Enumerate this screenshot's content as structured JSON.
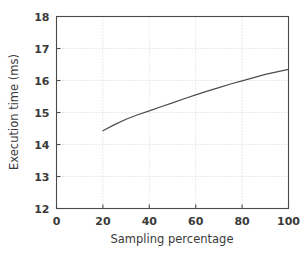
{
  "chart_data": {
    "type": "line",
    "title": "",
    "xlabel": "Sampling percentage",
    "ylabel": "Execution time (ms)",
    "xlim": [
      0,
      100
    ],
    "ylim": [
      12,
      18
    ],
    "xticks": [
      0,
      20,
      40,
      60,
      80,
      100
    ],
    "yticks": [
      12,
      13,
      14,
      15,
      16,
      17,
      18
    ],
    "xtick_labels": [
      "0",
      "20",
      "40",
      "60",
      "80",
      "100"
    ],
    "ytick_labels": [
      "12",
      "13",
      "14",
      "15",
      "16",
      "17",
      "18"
    ],
    "grid": true,
    "grid_style": "dotted",
    "legend": false,
    "legend_position": "none",
    "series": [
      {
        "name": "Execution time",
        "color": "#4d4d4d",
        "x": [
          20,
          25,
          30,
          35,
          40,
          45,
          50,
          55,
          60,
          65,
          70,
          75,
          80,
          85,
          90,
          95,
          100
        ],
        "values": [
          14.43,
          14.62,
          14.79,
          14.93,
          15.05,
          15.18,
          15.3,
          15.43,
          15.55,
          15.67,
          15.78,
          15.89,
          15.99,
          16.09,
          16.19,
          16.27,
          16.35
        ]
      }
    ]
  },
  "figure": {
    "background_color": "#ffffff",
    "frame_color": "#4a4a4a",
    "grid_color": "#c9c9c9",
    "text_color": "#3a3a3a"
  }
}
